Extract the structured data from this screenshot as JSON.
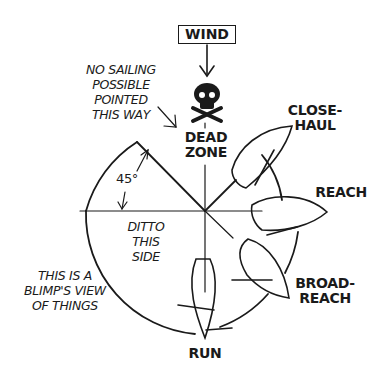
{
  "diagram": {
    "title_box": "WIND",
    "dead_zone": [
      "DEAD",
      "ZONE"
    ],
    "skull_icon": "skull-and-crossbones",
    "points_of_sail": [
      {
        "label_lines": [
          "CLOSE-",
          "HAUL"
        ]
      },
      {
        "label_lines": [
          "REACH"
        ]
      },
      {
        "label_lines": [
          "BROAD-",
          "REACH"
        ]
      },
      {
        "label_lines": [
          "RUN"
        ]
      }
    ],
    "angle_label": "45°",
    "notes": {
      "no_sailing": [
        "NO SAILING",
        "POSSIBLE",
        "POINTED",
        "THIS WAY"
      ],
      "ditto": [
        "DITTO",
        "THIS",
        "SIDE"
      ],
      "blimp": [
        "THIS IS A",
        "BLIMP'S VIEW",
        "OF THINGS"
      ]
    },
    "colors": {
      "ink": "#1a1a1a",
      "background": "#ffffff"
    }
  }
}
